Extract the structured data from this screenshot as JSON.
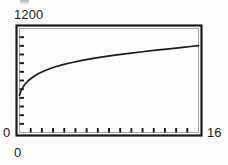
{
  "figure": {
    "background_color": "#ffffff",
    "ink_color": "#1b1b1b",
    "artifact_label": "scan-artifact-top"
  },
  "labels": {
    "y_max": "1200",
    "y_min": "0",
    "x_min": "0",
    "x_max": "16"
  },
  "chart_data": {
    "type": "line",
    "title": "",
    "subtitle": "",
    "xlabel": "",
    "ylabel": "",
    "xlim": [
      0,
      16
    ],
    "ylim": [
      0,
      1200
    ],
    "xtick_labels": [
      "0",
      "16"
    ],
    "ytick_labels": [
      "0",
      "1200"
    ],
    "x_minor_tick_count": 16,
    "y_minor_tick_count": 12,
    "grid": false,
    "legend": false,
    "legend_position": "none",
    "frame": "box",
    "annotations": [],
    "series": [
      {
        "name": "curve",
        "color": "#1b1b1b",
        "x": [
          0.0,
          0.1,
          0.25,
          0.5,
          0.8,
          1.2,
          1.7,
          2.3,
          3.0,
          3.8,
          4.7,
          5.6,
          6.6,
          7.6,
          8.7,
          9.8,
          11.0,
          12.2,
          13.4,
          14.6,
          15.3,
          16.0
        ],
        "y": [
          430,
          470,
          512,
          560,
          600,
          640,
          680,
          715,
          750,
          780,
          808,
          832,
          855,
          876,
          896,
          914,
          932,
          950,
          966,
          982,
          992,
          1002
        ]
      }
    ]
  }
}
